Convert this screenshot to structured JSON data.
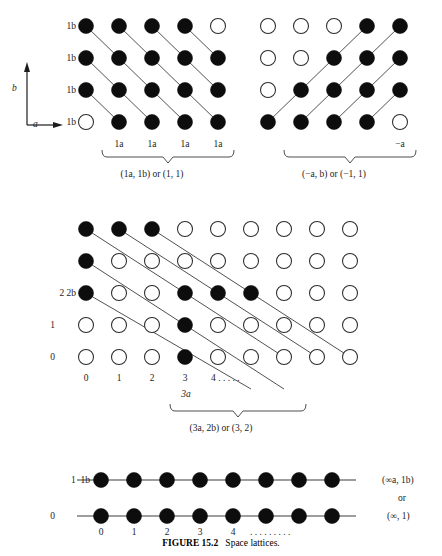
{
  "figure": {
    "number": "FIGURE 15.2",
    "title": "Space lattices."
  },
  "axis_key": {
    "vertical_label": "b",
    "horizontal_label": "a"
  },
  "panels": [
    {
      "id": "panel-top-left",
      "caption": "(1a, 1b) or (1, 1)",
      "y_labels": [
        "1b",
        "1b",
        "1b",
        "1b"
      ],
      "x_labels": [
        "1a",
        "1a",
        "1a",
        "1a"
      ],
      "cols": 5,
      "rows": 4,
      "origin": {
        "x": 86,
        "y": 26
      },
      "step": {
        "x": 33,
        "y": 32
      },
      "radius": 7.5,
      "filled": [
        [
          true,
          true,
          true,
          true,
          false
        ],
        [
          true,
          true,
          true,
          true,
          true
        ],
        [
          true,
          true,
          true,
          true,
          true
        ],
        [
          false,
          true,
          true,
          true,
          true
        ]
      ],
      "lines": [
        {
          "from": [
            0,
            0
          ],
          "to": [
            1,
            1
          ]
        },
        {
          "from": [
            1,
            0
          ],
          "to": [
            2,
            1
          ]
        },
        {
          "from": [
            2,
            0
          ],
          "to": [
            3,
            1
          ]
        },
        {
          "from": [
            3,
            0
          ],
          "to": [
            4,
            1
          ]
        },
        {
          "from": [
            0,
            1
          ],
          "to": [
            1,
            2
          ]
        },
        {
          "from": [
            1,
            1
          ],
          "to": [
            2,
            2
          ]
        },
        {
          "from": [
            2,
            1
          ],
          "to": [
            3,
            2
          ]
        },
        {
          "from": [
            3,
            1
          ],
          "to": [
            4,
            2
          ]
        },
        {
          "from": [
            0,
            2
          ],
          "to": [
            1,
            3
          ]
        },
        {
          "from": [
            1,
            2
          ],
          "to": [
            2,
            3
          ]
        },
        {
          "from": [
            2,
            2
          ],
          "to": [
            3,
            3
          ]
        },
        {
          "from": [
            3,
            2
          ],
          "to": [
            4,
            3
          ]
        }
      ]
    },
    {
      "id": "panel-top-right",
      "caption": "(−a, b) or (−1, 1)",
      "x_labels": [
        "−a"
      ],
      "cols": 5,
      "rows": 4,
      "origin": {
        "x": 268,
        "y": 26
      },
      "step": {
        "x": 33,
        "y": 32
      },
      "radius": 7.5,
      "filled": [
        [
          false,
          false,
          false,
          true,
          true
        ],
        [
          false,
          false,
          true,
          true,
          true
        ],
        [
          false,
          true,
          true,
          true,
          true
        ],
        [
          true,
          true,
          true,
          true,
          false
        ]
      ],
      "lines": [
        {
          "from": [
            3,
            0
          ],
          "to": [
            0,
            3
          ]
        },
        {
          "from": [
            4,
            0
          ],
          "to": [
            1,
            3
          ]
        },
        {
          "from": [
            4,
            1
          ],
          "to": [
            2,
            3
          ]
        },
        {
          "from": [
            4,
            2
          ],
          "to": [
            3,
            3
          ]
        }
      ]
    },
    {
      "id": "panel-middle",
      "caption": "(3a, 2b) or (3, 2)",
      "y_labels": [
        "2 2b",
        "1",
        "0"
      ],
      "x_labels": [
        "0",
        "1",
        "2",
        "3",
        "4 . . . . ."
      ],
      "x_sub_label": "3a",
      "cols": 9,
      "rows": 6,
      "origin": {
        "x": 86,
        "y": 229
      },
      "step": {
        "x": 33,
        "y": 32
      },
      "radius": 7.5,
      "filled": [
        [
          true,
          true,
          true,
          false,
          false,
          false,
          false,
          false,
          false
        ],
        [
          true,
          false,
          false,
          false,
          false,
          false,
          false,
          false,
          false
        ],
        [
          true,
          false,
          false,
          true,
          true,
          true,
          false,
          false,
          false
        ],
        [
          false,
          false,
          false,
          true,
          false,
          false,
          false,
          false,
          false
        ],
        [
          false,
          false,
          false,
          true,
          false,
          false,
          false,
          false,
          false
        ]
      ],
      "lines": [
        {
          "from": [
            0,
            0
          ],
          "to": [
            6,
            4
          ]
        },
        {
          "from": [
            1,
            0
          ],
          "to": [
            7,
            4
          ]
        },
        {
          "from": [
            2,
            0
          ],
          "to": [
            8,
            4
          ]
        },
        {
          "from": [
            0,
            1
          ],
          "to": [
            6,
            5
          ]
        },
        {
          "from": [
            0,
            2
          ],
          "to": [
            5,
            5
          ]
        }
      ]
    },
    {
      "id": "panel-bottom",
      "caption_right": [
        "(∞a, 1b)",
        "or",
        "(∞, 1)"
      ],
      "y_labels": [
        "1  1b",
        "0"
      ],
      "x_labels": [
        "0",
        "1",
        "2",
        "3",
        "4",
        ". . . . . . . . ."
      ],
      "cols": 8,
      "rows": 2,
      "origin": {
        "x": 101,
        "y": 480
      },
      "step": {
        "x": 33,
        "y": 36
      },
      "radius": 7.5,
      "filled": [
        [
          true,
          true,
          true,
          true,
          true,
          true,
          true,
          true
        ],
        [
          true,
          true,
          true,
          true,
          true,
          true,
          true,
          true
        ]
      ],
      "rows_as_lines": true
    }
  ],
  "colors": {
    "filled_node": "#0d0d0d",
    "open_node_stroke": "#2b2b2b",
    "line": "#3d3d3d",
    "text": "#1c1c1c",
    "background": "#ffffff"
  }
}
